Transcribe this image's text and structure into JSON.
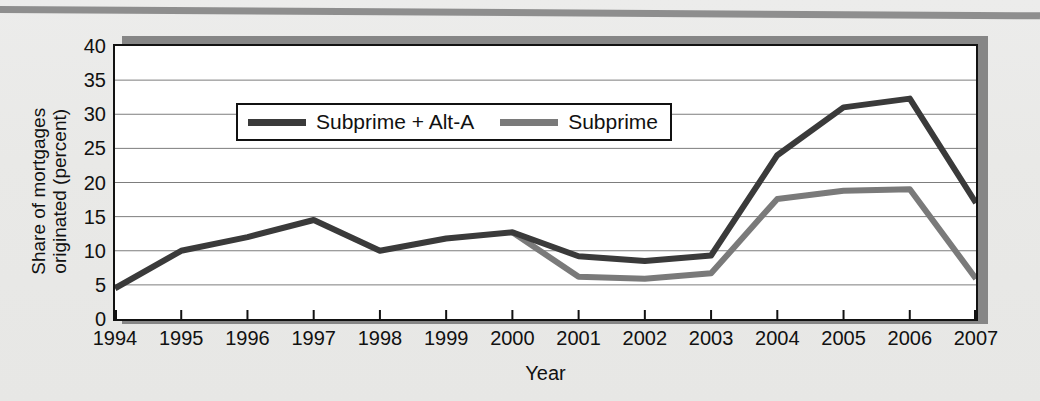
{
  "figure": {
    "background_color": "#e9e9e7",
    "plot_background": "#ffffff",
    "axis_color": "#121212",
    "shadow_color": "#868686"
  },
  "legend": {
    "position": "top-left-inside",
    "entries": [
      {
        "label": "Subprime + Alt-A",
        "color": "#3a3a3a"
      },
      {
        "label": "Subprime",
        "color": "#7a7a7a"
      }
    ]
  },
  "chart_data": {
    "type": "line",
    "title": "",
    "xlabel": "Year",
    "ylabel": "Share of mortgages originated (percent)",
    "ylabel_line1": "Share of mortgages",
    "ylabel_line2": "originated (percent)",
    "categories": [
      "1994",
      "1995",
      "1996",
      "1997",
      "1998",
      "1999",
      "2000",
      "2001",
      "2002",
      "2003",
      "2004",
      "2005",
      "2006",
      "2007"
    ],
    "x": [
      1994,
      1995,
      1996,
      1997,
      1998,
      1999,
      2000,
      2001,
      2002,
      2003,
      2004,
      2005,
      2006,
      2007
    ],
    "xlim": [
      1994,
      2007
    ],
    "ylim": [
      0,
      40
    ],
    "yticks": [
      0,
      5,
      10,
      15,
      20,
      25,
      30,
      35,
      40
    ],
    "ytick_labels": [
      "0",
      "5",
      "10",
      "15",
      "20",
      "25",
      "30",
      "35",
      "40"
    ],
    "grid": "horizontal",
    "series": [
      {
        "name": "Subprime + Alt-A",
        "color": "#3a3a3a",
        "values": [
          4.5,
          10.0,
          12.0,
          14.5,
          10.0,
          11.8,
          12.7,
          9.2,
          8.5,
          9.3,
          24.0,
          31.0,
          32.3,
          17.0
        ]
      },
      {
        "name": "Subprime",
        "color": "#7a7a7a",
        "values": [
          null,
          null,
          null,
          null,
          null,
          null,
          12.7,
          6.2,
          5.9,
          6.7,
          17.6,
          18.8,
          19.0,
          5.9
        ]
      }
    ]
  }
}
